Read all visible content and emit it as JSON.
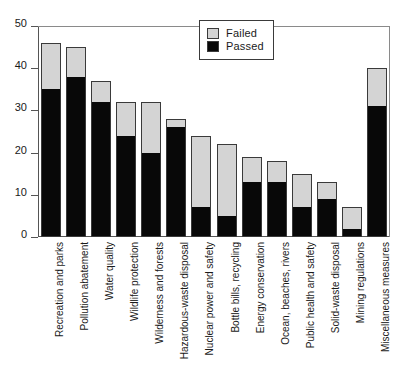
{
  "chart_data": {
    "type": "bar",
    "stacked": true,
    "title": "",
    "xlabel": "",
    "ylabel": "",
    "ylim": [
      0,
      50
    ],
    "yticks": [
      0,
      10,
      20,
      30,
      40,
      50
    ],
    "grid": false,
    "legend_position": "top-right",
    "categories": [
      "Recreation and parks",
      "Pollution abatement",
      "Water quality",
      "Wildlife protection",
      "Wilderness and forests",
      "Hazardous-waste disposal",
      "Nuclear power and safety",
      "Bottle bills, recycling",
      "Energy conservation",
      "Ocean, beaches, rivers",
      "Public health and safety",
      "Solid-waste disposal",
      "Mining regulations",
      "Miscellaneous measures"
    ],
    "series": [
      {
        "name": "Passed",
        "color": "#080808",
        "values": [
          35,
          38,
          32,
          24,
          20,
          26,
          7,
          5,
          13,
          13,
          7,
          9,
          2,
          31
        ]
      },
      {
        "name": "Failed",
        "color": "#d4d4d4",
        "values": [
          11,
          7,
          5,
          8,
          12,
          2,
          17,
          17,
          6,
          5,
          8,
          4,
          5,
          9
        ]
      }
    ],
    "totals": [
      46,
      45,
      37,
      32,
      32,
      28,
      24,
      22,
      19,
      18,
      15,
      13,
      7,
      40
    ]
  },
  "legend": {
    "items": [
      {
        "label": "Failed",
        "swatch": "failed"
      },
      {
        "label": "Passed",
        "swatch": "passed"
      }
    ]
  },
  "axis": {
    "y_tick_labels": [
      "50",
      "40",
      "30",
      "20",
      "10",
      "0"
    ]
  }
}
